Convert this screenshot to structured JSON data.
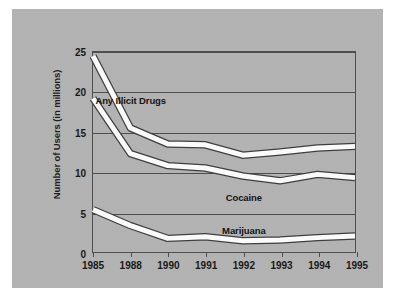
{
  "chart_data": {
    "type": "line",
    "title": "",
    "xlabel": "",
    "ylabel": "Number of Users (in millions)",
    "categories": [
      "1985",
      "1988",
      "1990",
      "1991",
      "1992",
      "1993",
      "1994",
      "1995"
    ],
    "ylim": [
      0,
      25
    ],
    "yticks": [
      0,
      5,
      10,
      15,
      20,
      25
    ],
    "ytick_labels": [
      "0",
      "5",
      "10",
      "15",
      "20",
      "25"
    ],
    "grid": "horizontal",
    "legend": "inline-annotations",
    "line_color": "#ffffff",
    "line_outline_color": "#3c3c3c",
    "background_color": "#b5b5b5",
    "frame_color": "#4c4c4c",
    "series": [
      {
        "name": "Any Illicit Drugs",
        "values": [
          24.5,
          15.5,
          13.5,
          13.4,
          12.1,
          12.5,
          13.0,
          13.2
        ],
        "label_x_category": "1988",
        "label_value": 19.0
      },
      {
        "name": "Cocaine",
        "values": [
          19.2,
          12.3,
          10.8,
          10.5,
          9.5,
          8.9,
          9.7,
          9.3
        ],
        "label_x_category": "1992",
        "label_value": 7.0
      },
      {
        "name": "Marijuana",
        "values": [
          5.3,
          3.3,
          1.7,
          1.9,
          1.4,
          1.5,
          1.8,
          2.0
        ],
        "label_x_category": "1992",
        "label_value": 3.0
      }
    ],
    "annotations": [
      {
        "text": "Any Illicit Drugs",
        "series": "Any Illicit Drugs"
      },
      {
        "text": "Cocaine",
        "series": "Cocaine"
      },
      {
        "text": "Marijuana",
        "series": "Marijuana"
      }
    ]
  }
}
